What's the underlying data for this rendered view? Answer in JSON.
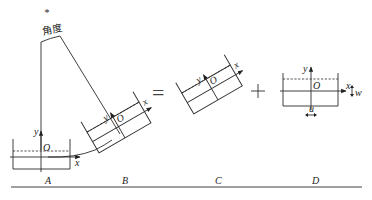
{
  "diagram": {
    "angle_label": "角度",
    "top_marker": "*",
    "equals_sign": "=",
    "plus_sign": "+",
    "axes": {
      "x": "x",
      "y": "y",
      "origin": "O"
    },
    "extra_labels": {
      "u": "u",
      "w": "w"
    },
    "panels": [
      {
        "id": "A",
        "label": "A"
      },
      {
        "id": "B",
        "label": "B"
      },
      {
        "id": "C",
        "label": "C"
      },
      {
        "id": "D",
        "label": "D"
      }
    ]
  }
}
